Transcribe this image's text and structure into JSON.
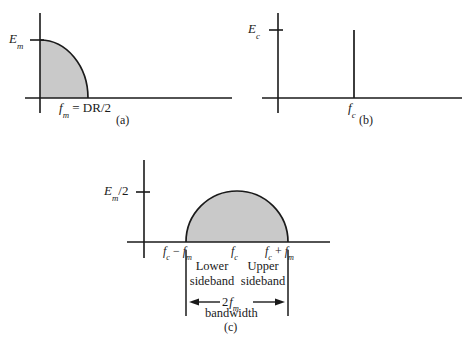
{
  "figure": {
    "fill_color": "#c9c9c9",
    "stroke_color": "#1a1a1a",
    "background": "#ffffff"
  },
  "panels": [
    {
      "id": "a",
      "caption": "(a)",
      "type": "quarter-circle-area",
      "y_axis_label": {
        "base": "E",
        "sub": "m"
      },
      "x_axis_label": {
        "base": "f",
        "sub": "m",
        "suffix": " = DR/2"
      },
      "x_axis_label_plain": "fm = DR/2",
      "y_axis_label_plain": "Em",
      "geometry": {
        "origin_x": 40,
        "baseline_y": 98,
        "axis_top_y": 13,
        "axis_bottom_y": 113,
        "axis_right_x": 232,
        "peak_y": 40,
        "edge_x": 88
      }
    },
    {
      "id": "b",
      "caption": "(b)",
      "type": "single-spike",
      "y_axis_label": {
        "base": "E",
        "sub": "c"
      },
      "x_axis_label": {
        "base": "f",
        "sub": "c"
      },
      "x_axis_label_plain": "fc",
      "y_axis_label_plain": "Ec",
      "geometry": {
        "origin_x": 278,
        "baseline_y": 98,
        "axis_top_y": 13,
        "axis_bottom_y": 113,
        "axis_right_x": 462,
        "spike_x": 354,
        "spike_top_y": 30,
        "tick_y": 30
      }
    },
    {
      "id": "c",
      "caption": "(c)",
      "type": "semicircle-area",
      "y_axis_label": {
        "base": "E",
        "sub": "m",
        "suffix": "/2"
      },
      "y_axis_label_plain": "Em/2",
      "x_tick_labels": [
        {
          "text_plain": "fc - fm",
          "base": "f",
          "sub": "c",
          "op": " − ",
          "base2": "f",
          "sub2": "m",
          "x": 186
        },
        {
          "text_plain": "fc",
          "base": "f",
          "sub": "c",
          "x": 237
        },
        {
          "text_plain": "fc + fm",
          "base": "f",
          "sub": "c",
          "op": " + ",
          "base2": "f",
          "sub2": "m",
          "x": 288
        }
      ],
      "sideband_labels": [
        {
          "line1": "Lower",
          "line2": "sideband",
          "x": 211
        },
        {
          "line1": "Upper",
          "line2": "sideband",
          "x": 263
        }
      ],
      "bandwidth": {
        "value_base": "2",
        "value_math": "f",
        "value_sub": "m",
        "value_plain": "2 fm",
        "label": "bandwidth",
        "arrow_y": 302,
        "left_x": 186,
        "right_x": 288
      },
      "geometry": {
        "origin_x": 144,
        "baseline_y": 242,
        "axis_top_y": 160,
        "axis_bottom_y": 258,
        "axis_right_x": 330,
        "axis_left_x": 127,
        "semicircle_left_x": 186,
        "semicircle_right_x": 288,
        "semicircle_peak_y": 191,
        "tick_y": 192,
        "guide_top_y": 250,
        "guide_bottom_y": 316
      }
    }
  ]
}
